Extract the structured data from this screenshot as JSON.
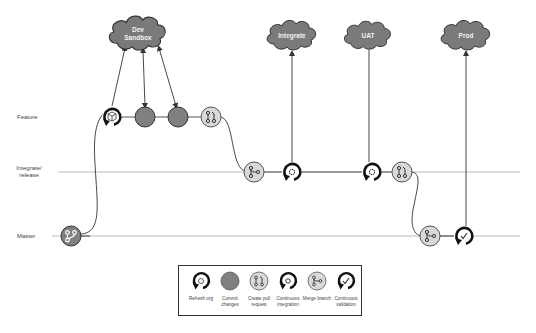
{
  "rows": {
    "feature": "Feature",
    "integrate_release_1": "Integrate/",
    "integrate_release_2": "release",
    "master": "Master"
  },
  "clouds": {
    "dev_sandbox_1": "Dev",
    "dev_sandbox_2": "Sandbox",
    "integrate": "Integrate",
    "uat": "UAT",
    "prod": "Prod"
  },
  "legend": {
    "items": [
      {
        "label": "Refresh org",
        "icon": "refresh-org-icon"
      },
      {
        "label": "Commit changes",
        "icon": "commit-icon"
      },
      {
        "label": "Create pull request",
        "icon": "pull-request-icon"
      },
      {
        "label": "Continuous integration",
        "icon": "continuous-integration-icon"
      },
      {
        "label": "Merge branch",
        "icon": "merge-branch-icon"
      },
      {
        "label": "Continuous validation",
        "icon": "continuous-validation-icon"
      }
    ]
  },
  "colors": {
    "cloud_fill": "#7a7a7a",
    "commit_fill": "#808080",
    "light_node_fill": "#d9d9d9",
    "line": "#333333",
    "track_line": "#bbbbbb"
  }
}
